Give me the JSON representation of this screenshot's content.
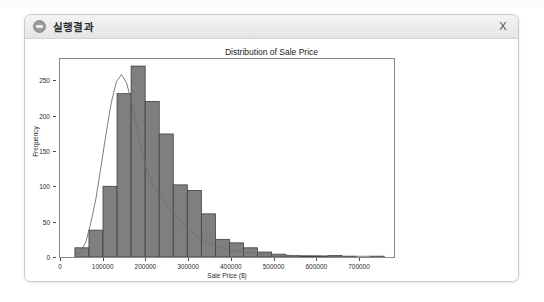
{
  "window": {
    "title": "실행결과",
    "icon": "app-disc-icon",
    "close_label": "X"
  },
  "chart_data": {
    "type": "bar",
    "title": "Distribution of Sale Price",
    "xlabel": "Sale Price ($)",
    "ylabel": "Frequency",
    "xlim": [
      0,
      782000
    ],
    "ylim": [
      0,
      280
    ],
    "xticks": [
      0,
      100000,
      200000,
      300000,
      400000,
      500000,
      600000,
      700000
    ],
    "xtick_labels": [
      "0",
      "100000",
      "200000",
      "300000",
      "400000",
      "500000",
      "600000",
      "700000"
    ],
    "yticks": [
      0,
      50,
      100,
      150,
      200,
      250
    ],
    "ytick_labels": [
      "0",
      "50",
      "100",
      "150",
      "200",
      "250"
    ],
    "grid": false,
    "legend": false,
    "bin_edges": [
      34900,
      67800,
      100700,
      133600,
      166500,
      199400,
      232300,
      265200,
      298100,
      331000,
      363900,
      396800,
      429700,
      462600,
      495500,
      528400,
      561300,
      594200,
      627100,
      660000,
      692900,
      725800,
      758700
    ],
    "values": [
      13,
      38,
      100,
      231,
      270,
      220,
      174,
      102,
      94,
      61,
      25,
      20,
      13,
      7,
      4,
      2,
      1,
      1,
      2,
      1,
      0,
      1
    ],
    "bar_color": "#7f7f7f",
    "bar_edge_color": "#3f3f3f",
    "kde_color": "#6e6e6e",
    "kde_points": [
      [
        34900,
        2
      ],
      [
        48000,
        8
      ],
      [
        60000,
        20
      ],
      [
        72000,
        48
      ],
      [
        84000,
        82
      ],
      [
        96000,
        128
      ],
      [
        108000,
        175
      ],
      [
        120000,
        218
      ],
      [
        132000,
        248
      ],
      [
        144000,
        258
      ],
      [
        156000,
        246
      ],
      [
        168000,
        218
      ],
      [
        180000,
        182
      ],
      [
        192000,
        148
      ],
      [
        204000,
        122
      ],
      [
        216000,
        104
      ],
      [
        228000,
        92
      ],
      [
        240000,
        82
      ],
      [
        252000,
        72
      ],
      [
        264000,
        63
      ],
      [
        276000,
        55
      ],
      [
        288000,
        47
      ],
      [
        300000,
        40
      ],
      [
        315000,
        32
      ],
      [
        330000,
        26
      ],
      [
        345000,
        21
      ],
      [
        360000,
        17
      ],
      [
        380000,
        13
      ],
      [
        400000,
        10
      ],
      [
        420000,
        8
      ],
      [
        440000,
        6
      ],
      [
        460000,
        5
      ],
      [
        480000,
        4
      ],
      [
        510000,
        3
      ],
      [
        550000,
        2
      ],
      [
        600000,
        2
      ],
      [
        650000,
        1
      ],
      [
        700000,
        1
      ],
      [
        760000,
        1
      ]
    ]
  }
}
